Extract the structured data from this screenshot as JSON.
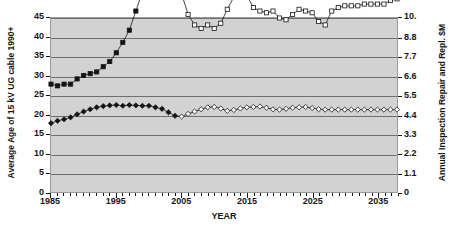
{
  "chart_data": {
    "type": "line",
    "title": "",
    "xlabel": "YEAR",
    "ylabel": "Average Age of 15 kV UG cable 1990+",
    "y2label": "Annual Inspection Repair and Repl. $M",
    "xlim": [
      1985,
      2038
    ],
    "ylim": [
      0,
      45
    ],
    "y2lim": [
      0,
      10
    ],
    "grid": true,
    "legend_position": "none",
    "background_color": "#d2d2d2",
    "series_color": "#141414",
    "x_ticks": [
      1985,
      1995,
      2005,
      2015,
      2025,
      2035
    ],
    "x_tick_labels": [
      "1985",
      "1995",
      "2005",
      "2015",
      "2025",
      "2035"
    ],
    "y_ticks": [
      0,
      5,
      10,
      15,
      20,
      25,
      30,
      35,
      40,
      45
    ],
    "y_tick_labels": [
      "0",
      "5",
      "10",
      "15",
      "20",
      "25",
      "30",
      "35",
      "40",
      "45"
    ],
    "y2_ticks": [
      0,
      1.1,
      2.2,
      3.3,
      4.4,
      5.5,
      6.6,
      7.7,
      8.8,
      10
    ],
    "y2_tick_labels": [
      "0",
      "1.1",
      "2.2",
      "3.3",
      "4.4",
      "5.5",
      "6.6",
      "7.7",
      "8.8",
      "10."
    ],
    "x": [
      1985,
      1986,
      1987,
      1988,
      1989,
      1990,
      1991,
      1992,
      1993,
      1994,
      1995,
      1996,
      1997,
      1998,
      1999,
      2000,
      2001,
      2002,
      2003,
      2004,
      2005,
      2006,
      2007,
      2008,
      2009,
      2010,
      2011,
      2012,
      2013,
      2014,
      2015,
      2016,
      2017,
      2018,
      2019,
      2020,
      2021,
      2022,
      2023,
      2024,
      2025,
      2026,
      2027,
      2028,
      2029,
      2030,
      2031,
      2032,
      2033,
      2034,
      2035,
      2036,
      2037,
      2038
    ],
    "series": [
      {
        "name": "Average Age of 15 kV UG cable 1990+",
        "axis": "left",
        "marker": "diamond",
        "historical_marker": "filled-diamond",
        "forecast_marker": "hollow-diamond",
        "forecast_start_year": 2005,
        "values": [
          17.8,
          18.4,
          18.8,
          19.3,
          20.1,
          20.8,
          21.4,
          21.9,
          22.2,
          22.4,
          22.5,
          22.3,
          22.5,
          22.4,
          22.3,
          22.3,
          21.9,
          21.5,
          20.6,
          19.7,
          19.5,
          20.2,
          20.8,
          21.4,
          21.9,
          22.0,
          21.6,
          21.0,
          21.2,
          21.6,
          21.9,
          22.0,
          22.1,
          21.8,
          21.4,
          21.3,
          21.5,
          21.8,
          21.9,
          22.0,
          21.7,
          21.4,
          21.3,
          21.3,
          21.3,
          21.3,
          21.3,
          21.3,
          21.3,
          21.3,
          21.3,
          21.3,
          21.3,
          21.3
        ]
      },
      {
        "name": "Annual Inspection Repair and Repl. $M",
        "axis": "right",
        "marker": "square",
        "historical_marker": "filled-square",
        "forecast_marker": "hollow-square",
        "forecast_start_year": 2005,
        "values": [
          6.2,
          6.1,
          6.2,
          6.2,
          6.5,
          6.7,
          6.8,
          6.9,
          7.2,
          7.5,
          8.0,
          8.6,
          9.3,
          10.4,
          11.5,
          12.4,
          13.1,
          13.5,
          13.4,
          12.3,
          11.4,
          10.2,
          9.6,
          9.4,
          9.6,
          9.4,
          9.7,
          10.5,
          11.2,
          11.3,
          11.3,
          10.6,
          10.4,
          10.3,
          10.4,
          10.0,
          9.9,
          10.2,
          10.5,
          10.4,
          10.3,
          9.8,
          9.6,
          10.4,
          10.6,
          10.7,
          10.7,
          10.7,
          10.8,
          10.8,
          10.8,
          10.8,
          11.0,
          11.1
        ]
      }
    ]
  }
}
